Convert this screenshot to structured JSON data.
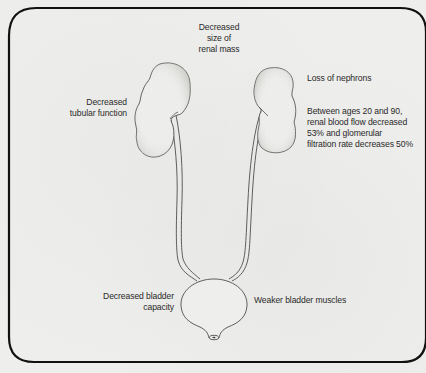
{
  "diagram": {
    "structures": {
      "left_kidney": "kidney",
      "right_kidney": "kidney",
      "left_ureter": "ureter",
      "right_ureter": "ureter",
      "bladder": "bladder",
      "urethra_opening": "urethra"
    },
    "colors": {
      "background": "#eeeeec",
      "stroke": "#3a3a3a",
      "border": "#111111",
      "text": "#2a2a2a"
    },
    "labels": {
      "renal_mass": "Decreased\nsize of\nrenal mass",
      "tubular_function": "Decreased\ntubular function",
      "nephrons": "Loss of nephrons",
      "blood_flow": "Between ages 20 and 90,\nrenal blood flow decreased\n53% and glomerular\nfiltration rate decreases 50%",
      "bladder_capacity": "Decreased bladder\ncapacity",
      "bladder_muscles": "Weaker bladder muscles"
    }
  }
}
